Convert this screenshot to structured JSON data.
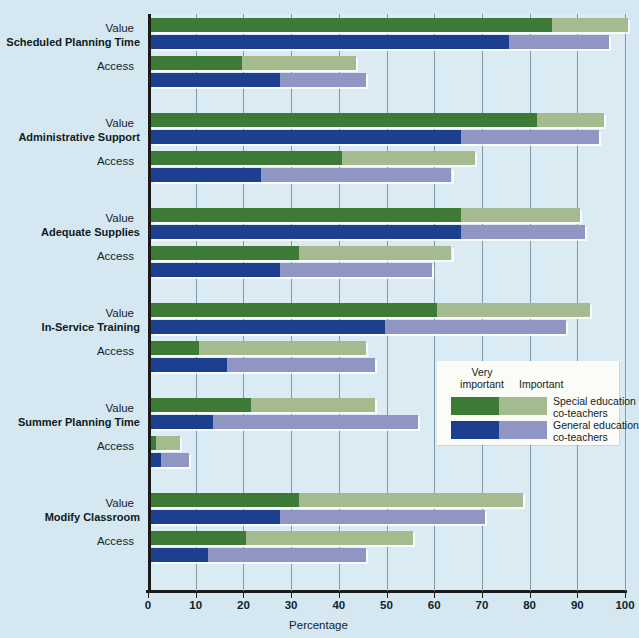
{
  "chart_data": {
    "type": "bar",
    "orientation": "horizontal",
    "stacked": true,
    "title": "",
    "xlabel": "Percentage",
    "ylabel": "",
    "xlim": [
      0,
      100
    ],
    "xticks": [
      0,
      10,
      20,
      30,
      40,
      50,
      60,
      70,
      80,
      90,
      100
    ],
    "grid": "vertical",
    "legend_position": "middle-right",
    "segment_labels": [
      "Very important",
      "Important"
    ],
    "series": [
      {
        "name": "Special education co-teachers",
        "very_important_color": "#3c7a36",
        "important_color": "#a3bb8e"
      },
      {
        "name": "General education co-teachers",
        "very_important_color": "#1d3f8f",
        "important_color": "#8f96c4"
      }
    ],
    "categories": [
      "Scheduled Planning Time",
      "Administrative Support",
      "Adequate Supplies",
      "In-Service Training",
      "Summer Planning Time",
      "Modify Classroom"
    ],
    "measures": [
      "Value",
      "Access"
    ],
    "groups": [
      {
        "category": "Scheduled Planning Time",
        "rows": [
          {
            "measure": "Value",
            "special": {
              "very_important": 84,
              "important": 16,
              "total": 100
            },
            "general": {
              "very_important": 75,
              "important": 21,
              "total": 96
            }
          },
          {
            "measure": "Access",
            "special": {
              "very_important": 19,
              "important": 24,
              "total": 43
            },
            "general": {
              "very_important": 27,
              "important": 18,
              "total": 45
            }
          }
        ]
      },
      {
        "category": "Administrative Support",
        "rows": [
          {
            "measure": "Value",
            "special": {
              "very_important": 81,
              "important": 14,
              "total": 95
            },
            "general": {
              "very_important": 65,
              "important": 29,
              "total": 94
            }
          },
          {
            "measure": "Access",
            "special": {
              "very_important": 40,
              "important": 28,
              "total": 68
            },
            "general": {
              "very_important": 23,
              "important": 40,
              "total": 63
            }
          }
        ]
      },
      {
        "category": "Adequate Supplies",
        "rows": [
          {
            "measure": "Value",
            "special": {
              "very_important": 65,
              "important": 25,
              "total": 90
            },
            "general": {
              "very_important": 65,
              "important": 26,
              "total": 91
            }
          },
          {
            "measure": "Access",
            "special": {
              "very_important": 31,
              "important": 32,
              "total": 63
            },
            "general": {
              "very_important": 27,
              "important": 32,
              "total": 59
            }
          }
        ]
      },
      {
        "category": "In-Service Training",
        "rows": [
          {
            "measure": "Value",
            "special": {
              "very_important": 60,
              "important": 32,
              "total": 92
            },
            "general": {
              "very_important": 49,
              "important": 38,
              "total": 87
            }
          },
          {
            "measure": "Access",
            "special": {
              "very_important": 10,
              "important": 35,
              "total": 45
            },
            "general": {
              "very_important": 16,
              "important": 31,
              "total": 47
            }
          }
        ]
      },
      {
        "category": "Summer Planning Time",
        "rows": [
          {
            "measure": "Value",
            "special": {
              "very_important": 21,
              "important": 26,
              "total": 47
            },
            "general": {
              "very_important": 13,
              "important": 43,
              "total": 56
            }
          },
          {
            "measure": "Access",
            "special": {
              "very_important": 1,
              "important": 5,
              "total": 6
            },
            "general": {
              "very_important": 2,
              "important": 6,
              "total": 8
            }
          }
        ]
      },
      {
        "category": "Modify Classroom",
        "rows": [
          {
            "measure": "Value",
            "special": {
              "very_important": 31,
              "important": 47,
              "total": 78
            },
            "general": {
              "very_important": 27,
              "important": 43,
              "total": 70
            }
          },
          {
            "measure": "Access",
            "special": {
              "very_important": 20,
              "important": 35,
              "total": 55
            },
            "general": {
              "very_important": 12,
              "important": 33,
              "total": 45
            }
          }
        ]
      }
    ]
  },
  "legend": {
    "header_very": "Very\nimportant",
    "header_very_line1": "Very",
    "header_very_line2": "important",
    "header_important": "Important",
    "rows": [
      {
        "label_line1": "Special education",
        "label_line2": "co-teachers"
      },
      {
        "label_line1": "General education",
        "label_line2": "co-teachers"
      }
    ]
  },
  "axis": {
    "xlabel": "Percentage",
    "ticks": [
      "0",
      "10",
      "20",
      "30",
      "40",
      "50",
      "60",
      "70",
      "80",
      "90",
      "100"
    ]
  },
  "colors": {
    "background": "#d5e7f0",
    "plot_background": "#dbebf3",
    "axis": "#1a1a1a",
    "gridline": "#7f9aa8",
    "special_very": "#3c7a36",
    "special_important": "#a3bb8e",
    "general_very": "#1d3f8f",
    "general_important": "#8f96c4",
    "legend_background": "#fbfbf7"
  }
}
